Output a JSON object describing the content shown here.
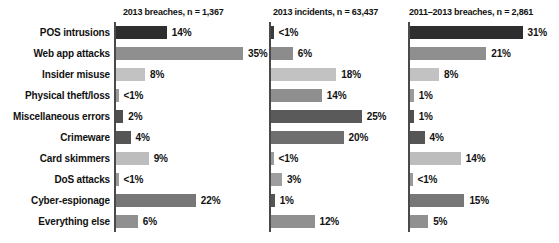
{
  "chart_data": {
    "type": "bar",
    "title": "",
    "orientation": "horizontal",
    "grid": false,
    "legend": false,
    "xlabel": "",
    "ylabel": "",
    "xlim": [
      0,
      35
    ],
    "categories": [
      "POS intrusions",
      "Web app attacks",
      "Insider misuse",
      "Physical theft/loss",
      "Miscellaneous errors",
      "Crimeware",
      "Card skimmers",
      "DoS attacks",
      "Cyber-espionage",
      "Everything else"
    ],
    "series": [
      {
        "name": "2013 breaches, n = 1,367",
        "labels": [
          "14%",
          "35%",
          "8%",
          "<1%",
          "2%",
          "4%",
          "9%",
          "<1%",
          "22%",
          "6%"
        ],
        "values": [
          14,
          35,
          8,
          0.4,
          2,
          4,
          9,
          0.4,
          22,
          6
        ],
        "colors": [
          "#2e2e2e",
          "#8f8f8f",
          "#c2c2c2",
          "#9a9a9a",
          "#4f4f4f",
          "#555555",
          "#bdbdbd",
          "#9a9a9a",
          "#777777",
          "#909090"
        ]
      },
      {
        "name": "2013 incidents, n = 63,437",
        "labels": [
          "<1%",
          "6%",
          "18%",
          "14%",
          "25%",
          "20%",
          "<1%",
          "3%",
          "1%",
          "12%"
        ],
        "values": [
          0.4,
          6,
          18,
          14,
          25,
          20,
          0.4,
          3,
          1,
          12
        ],
        "colors": [
          "#3a3a3a",
          "#8c8c8c",
          "#c2c2c2",
          "#8f8f8f",
          "#5a5a5a",
          "#6e6e6e",
          "#9a9a9a",
          "#9e9e9e",
          "#555555",
          "#909090"
        ]
      },
      {
        "name": "2011–2013 breaches, n = 2,861",
        "labels": [
          "31%",
          "21%",
          "8%",
          "1%",
          "1%",
          "4%",
          "14%",
          "<1%",
          "15%",
          "5%"
        ],
        "values": [
          31,
          21,
          8,
          1,
          1,
          4,
          14,
          0.4,
          15,
          5
        ],
        "colors": [
          "#2e2e2e",
          "#8f8f8f",
          "#c2c2c2",
          "#9a9a9a",
          "#4f4f4f",
          "#555555",
          "#bdbdbd",
          "#9a9a9a",
          "#777777",
          "#909090"
        ]
      }
    ]
  },
  "panels": [
    {
      "header": "2013 breaches, n = 1,367",
      "scale": 3.63
    },
    {
      "header": "2013 incidents, n = 63,437",
      "scale": 3.63
    },
    {
      "header": "2011–2013 breaches, n = 2,861",
      "scale": 3.63
    }
  ]
}
